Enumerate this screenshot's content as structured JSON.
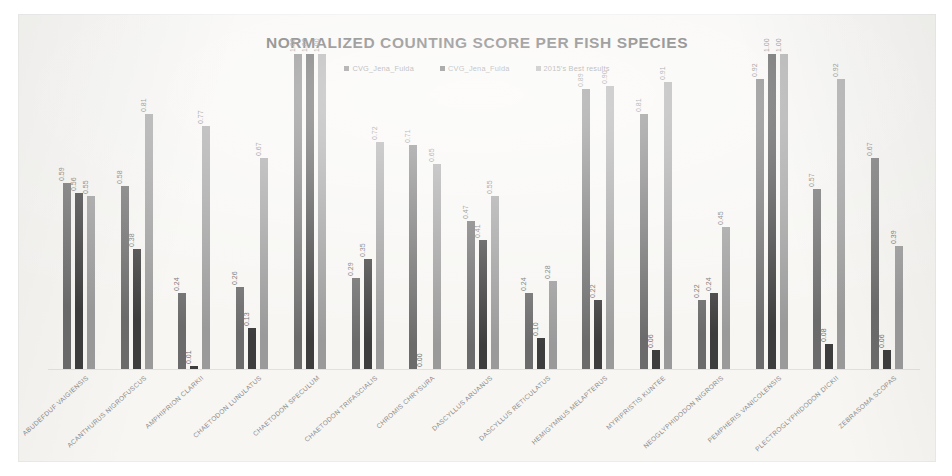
{
  "document": {
    "kind": "scanned-chart-page",
    "background_color": "#f7f6f3"
  },
  "chart_data": {
    "type": "bar",
    "title": "NORMALIZED COUNTING SCORE PER FISH SPECIES",
    "xlabel": "",
    "ylabel": "",
    "ylim": [
      0,
      1.0
    ],
    "grid": false,
    "legend_position": "top-center",
    "categories": [
      "ABUDEFDUF VAIGIENSIS",
      "ACANTHURUS NIGROFUSCUS",
      "AMPHIPRION CLARKII",
      "CHAETODON LUNULATUS",
      "CHAETODON SPECULUM",
      "CHAETODON TRIFASCIALIS",
      "CHROMIS CHRYSURA",
      "DASCYLLUS ARUANUS",
      "DASCYLLUS RETICULATUS",
      "HEMIGYMNUS MELAPTERUS",
      "MYRIPRISTIS KUNTEE",
      "NEOGLYPHIDODON NIGRORIS",
      "PEMPHERIS VANICOLENSIS",
      "PLECTROGLYPHIDODON DICKII",
      "ZEBRASOMA SCOPAS"
    ],
    "series": [
      {
        "name": "CVG_Jena_Fulda",
        "color": "#6b6b6b",
        "values": [
          0.59,
          0.58,
          0.24,
          0.26,
          1.0,
          0.29,
          0.71,
          0.47,
          0.24,
          0.89,
          0.81,
          0.22,
          0.92,
          0.57,
          0.67
        ],
        "labels": [
          "0.59",
          "0.58",
          "0.24",
          "0.26",
          "1.00",
          "0.29",
          "0.71",
          "0.47",
          "0.24",
          "0.89",
          "0.81",
          "0.22",
          "0.92",
          "0.57",
          "0.67"
        ]
      },
      {
        "name": "CVG_Jena_Fulda",
        "color": "#3d3d3d",
        "values": [
          0.56,
          0.38,
          0.01,
          0.13,
          1.0,
          0.35,
          0.0,
          0.41,
          0.1,
          0.22,
          0.06,
          0.24,
          1.0,
          0.08,
          0.06
        ],
        "labels": [
          "0.56",
          "0.38",
          "0.01",
          "0.13",
          "1.00",
          "0.35",
          "0.00",
          "0.41",
          "0.10",
          "0.22",
          "0.06",
          "0.24",
          "1.00",
          "0.08",
          "0.06"
        ]
      },
      {
        "name": "2015's Best results",
        "color": "#9a9a9a",
        "values": [
          0.55,
          0.81,
          0.77,
          0.67,
          1.0,
          0.72,
          0.65,
          0.55,
          0.28,
          0.9,
          0.91,
          0.45,
          1.0,
          0.92,
          0.39
        ],
        "labels": [
          "0.55",
          "0.81",
          "0.77",
          "0.67",
          "1.00",
          "0.72",
          "0.65",
          "0.55",
          "0.28",
          "0.90",
          "0.91",
          "0.45",
          "1.00",
          "0.92",
          "0.39"
        ]
      }
    ]
  }
}
